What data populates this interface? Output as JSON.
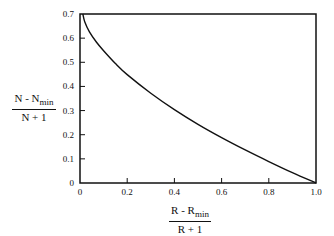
{
  "chart_data": {
    "type": "line",
    "title": "",
    "xlabel": {
      "numerator": "R - R",
      "numerator_sub": "min",
      "denominator": "R + 1"
    },
    "ylabel": {
      "numerator": "N - N",
      "numerator_sub": "min",
      "denominator": "N + 1"
    },
    "xlim": [
      0,
      1.0
    ],
    "ylim": [
      0,
      0.7
    ],
    "xticks": [
      0,
      0.2,
      0.4,
      0.6,
      0.8,
      1.0
    ],
    "xtick_labels": [
      "0",
      "0.2",
      "0.4",
      "0.6",
      "0.8",
      "1.0"
    ],
    "yticks": [
      0,
      0.1,
      0.2,
      0.3,
      0.4,
      0.5,
      0.6,
      0.7
    ],
    "ytick_labels": [
      "0",
      "0.1",
      "0.2",
      "0.3",
      "0.4",
      "0.5",
      "0.6",
      "0.7"
    ],
    "grid": false,
    "legend": "none",
    "series": [
      {
        "name": "correlation",
        "x": [
          0.012,
          0.02,
          0.04,
          0.07,
          0.1,
          0.15,
          0.2,
          0.3,
          0.4,
          0.5,
          0.6,
          0.7,
          0.8,
          0.9,
          1.0
        ],
        "y": [
          0.7,
          0.668,
          0.626,
          0.583,
          0.548,
          0.495,
          0.449,
          0.372,
          0.304,
          0.243,
          0.188,
          0.137,
          0.089,
          0.043,
          0.0
        ]
      }
    ]
  }
}
